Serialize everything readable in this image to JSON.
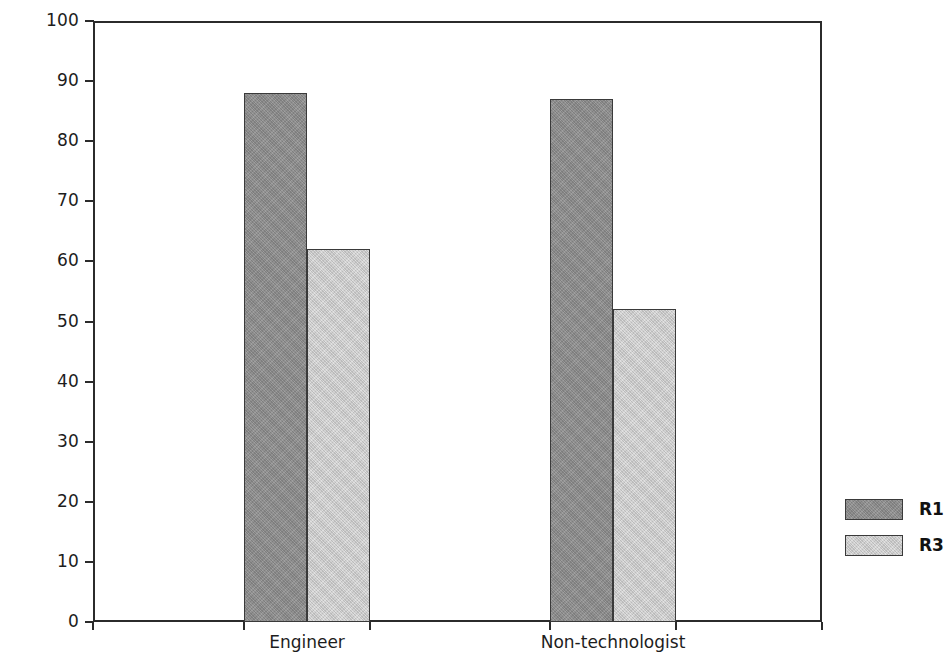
{
  "chart_data": {
    "type": "bar",
    "title": "",
    "subtitle": "",
    "xlabel": "",
    "ylabel": "Mean scores",
    "categories": [
      "Engineer",
      "Non-technologist"
    ],
    "series": [
      {
        "name": "R1",
        "values": [
          88,
          87
        ],
        "color": "#8d8d8d"
      },
      {
        "name": "R3",
        "values": [
          62,
          52
        ],
        "color": "#cdcdcd"
      }
    ],
    "ylim": [
      0,
      100
    ],
    "ytick_step": 10,
    "ytick_labels": [
      "0",
      "10",
      "20",
      "30",
      "40",
      "50",
      "60",
      "70",
      "80",
      "90",
      "100"
    ],
    "grid": false,
    "legend_position": "right",
    "frame": "box",
    "bar_border_color": "#3a3a3a",
    "axis_color": "#2b2b2b"
  },
  "legend": {
    "entries": [
      {
        "label": "R1",
        "series": "series-r1"
      },
      {
        "label": "R3",
        "series": "series-r3"
      }
    ]
  }
}
